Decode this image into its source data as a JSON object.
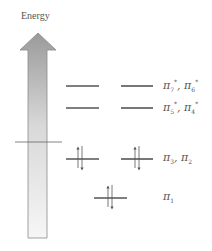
{
  "axis": {
    "label": "Energy"
  },
  "colors": {
    "level_line": "#555555",
    "arrow_fill_top": "#9a9a9a",
    "arrow_fill_bottom": "#f4f4f4",
    "arrow_stroke": "#888888",
    "spin_arrow": "#555555"
  },
  "levels": [
    {
      "name": "pi7-pi6-star",
      "label_main": "π",
      "sub1": "7",
      "sub2": "6",
      "star": "*",
      "electrons": 0
    },
    {
      "name": "pi5-pi4-star",
      "label_main": "π",
      "sub1": "5",
      "sub2": "4",
      "star": "*",
      "electrons": 0
    },
    {
      "name": "pi3-pi2",
      "label_main": "π",
      "sub1": "3",
      "sub2": "2",
      "electrons": 2
    },
    {
      "name": "pi1",
      "label_main": "π",
      "sub1": "1",
      "electrons": 2
    }
  ],
  "labels": {
    "l0": {
      "pi": "π",
      "a": "7",
      "b": "6",
      "star": "*",
      "sep": ", "
    },
    "l1": {
      "pi": "π",
      "a": "5",
      "b": "4",
      "star": "*",
      "sep": ", "
    },
    "l2": {
      "pi": "π",
      "a": "3",
      "b": "2",
      "sep": ", "
    },
    "l3": {
      "pi": "π",
      "a": "1"
    }
  }
}
